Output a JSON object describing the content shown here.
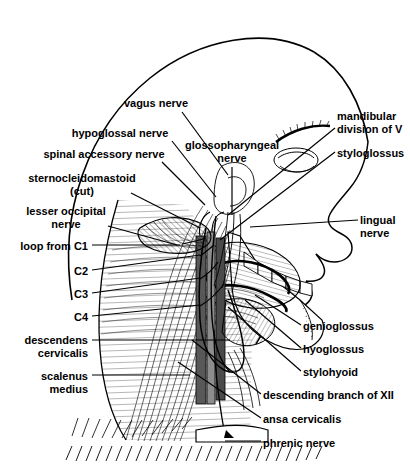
{
  "figure": {
    "width": 410,
    "height": 465,
    "background_color": "#ffffff",
    "ink_color": "#000000",
    "view": "left lateral"
  },
  "labels": [
    {
      "id": "vagus-nerve",
      "text": "vagus nerve",
      "align": "c",
      "x": 156,
      "y": 97,
      "line": [
        [
          182,
          112
        ],
        [
          228,
          175
        ]
      ]
    },
    {
      "id": "hypoglossal-nerve",
      "text": "hypoglossal nerve",
      "align": "c",
      "x": 120,
      "y": 127,
      "line": [
        [
          172,
          141
        ],
        [
          216,
          197
        ]
      ]
    },
    {
      "id": "glossopharyngeal-nerve",
      "text": "glossopharyngeal\nnerve",
      "align": "c",
      "x": 232,
      "y": 139,
      "line": [
        [
          232,
          167
        ],
        [
          232,
          215
        ]
      ]
    },
    {
      "id": "spinal-accessory-nerve",
      "text": "spinal accessory nerve",
      "align": "c",
      "x": 104,
      "y": 148,
      "line": [
        [
          162,
          162
        ],
        [
          205,
          205
        ]
      ]
    },
    {
      "id": "sternocleidomastoid",
      "text": "sternocleidomastoid\n(cut)",
      "align": "c",
      "x": 82,
      "y": 172,
      "line": [
        [
          131,
          193
        ],
        [
          200,
          228
        ]
      ]
    },
    {
      "id": "lesser-occipital-nerve",
      "text": "lesser occipital\nnerve",
      "align": "c",
      "x": 66,
      "y": 205,
      "line": [
        [
          108,
          226
        ],
        [
          177,
          245
        ]
      ]
    },
    {
      "id": "loop-from-c1",
      "text": "loop from C1",
      "align": "l",
      "x": 88,
      "y": 240,
      "line": [
        [
          92,
          245
        ],
        [
          180,
          245
        ]
      ]
    },
    {
      "id": "c2",
      "text": "C2",
      "align": "l",
      "x": 88,
      "y": 265,
      "line": [
        [
          92,
          270
        ],
        [
          200,
          255
        ]
      ]
    },
    {
      "id": "c3",
      "text": "C3",
      "align": "l",
      "x": 88,
      "y": 288,
      "line": [
        [
          92,
          293
        ],
        [
          200,
          278
        ]
      ]
    },
    {
      "id": "c4",
      "text": "C4",
      "align": "l",
      "x": 88,
      "y": 311,
      "line": [
        [
          92,
          316
        ],
        [
          200,
          305
        ]
      ]
    },
    {
      "id": "descendens-cervicalis",
      "text": "descendens\ncervicalis",
      "align": "l",
      "x": 88,
      "y": 334,
      "line": [
        [
          92,
          340
        ],
        [
          230,
          340
        ]
      ]
    },
    {
      "id": "scalenus-medius",
      "text": "scalenus\nmedius",
      "align": "l",
      "x": 88,
      "y": 370,
      "line": [
        [
          92,
          375
        ],
        [
          190,
          375
        ]
      ]
    },
    {
      "id": "mandibular-division-of-v",
      "text": "mandibular\ndivision of V",
      "align": "r",
      "x": 337,
      "y": 110,
      "line": [
        [
          335,
          128
        ],
        [
          228,
          215
        ]
      ]
    },
    {
      "id": "styloglossus",
      "text": "styloglossus",
      "align": "r",
      "x": 337,
      "y": 147,
      "line": [
        [
          335,
          152
        ],
        [
          220,
          240
        ]
      ]
    },
    {
      "id": "lingual-nerve",
      "text": "lingual\nnerve",
      "align": "r",
      "x": 360,
      "y": 214,
      "line": [
        [
          358,
          220
        ],
        [
          250,
          227
        ]
      ]
    },
    {
      "id": "genioglossus",
      "text": "genioglossus",
      "align": "r",
      "x": 303,
      "y": 320,
      "line": [
        [
          301,
          325
        ],
        [
          255,
          295
        ]
      ]
    },
    {
      "id": "hyoglossus",
      "text": "hyoglossus",
      "align": "r",
      "x": 303,
      "y": 343,
      "line": [
        [
          301,
          348
        ],
        [
          245,
          300
        ]
      ]
    },
    {
      "id": "stylohyoid",
      "text": "stylohyoid",
      "align": "r",
      "x": 303,
      "y": 366,
      "line": [
        [
          301,
          371
        ],
        [
          228,
          307
        ]
      ]
    },
    {
      "id": "descending-branch-of-xii",
      "text": "descending branch of XII",
      "align": "r",
      "x": 263,
      "y": 389,
      "line": [
        [
          261,
          394
        ],
        [
          192,
          340
        ]
      ]
    },
    {
      "id": "ansa-cervicalis",
      "text": "ansa cervicalis",
      "align": "r",
      "x": 263,
      "y": 413,
      "line": [
        [
          261,
          418
        ],
        [
          178,
          362
        ]
      ]
    },
    {
      "id": "phrenic-nerve",
      "text": "phrenic nerve",
      "align": "r",
      "x": 263,
      "y": 437,
      "line": [
        [
          261,
          441
        ],
        [
          225,
          441
        ]
      ]
    }
  ],
  "structures": {
    "cranium": "skull vault outline arc",
    "face": "facial profile with eyebrow, eye, nose, lips, chin",
    "mandible": "mandible with teeth and ramus",
    "tongue": "tongue with intrinsic and extrinsic musculature",
    "neck": "cervical region with carotid sheath, muscles and nerve plexus",
    "clavicle": "clavicle and first rib region at base of neck"
  }
}
